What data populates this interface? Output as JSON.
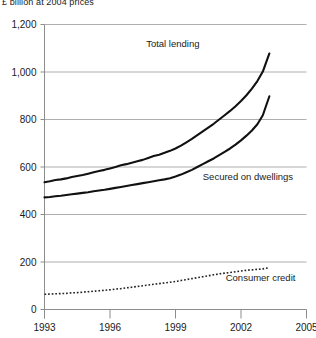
{
  "chart_data": {
    "type": "line",
    "title": "",
    "units_caption": "£ billion at 2004 prices",
    "xlabel": "",
    "ylabel": "",
    "xlim": [
      1993,
      2005
    ],
    "ylim": [
      0,
      1200
    ],
    "grid": true,
    "legend_position": "inline-annotations",
    "y_ticks": [
      "0",
      "200",
      "400",
      "600",
      "800",
      "1,000",
      "1,200"
    ],
    "y_tick_values": [
      0,
      200,
      400,
      600,
      800,
      1000,
      1200
    ],
    "x_ticks": [
      "1993",
      "1996",
      "1999",
      "2002",
      "2005"
    ],
    "x_tick_values": [
      1993,
      1996,
      1999,
      2002,
      2005
    ],
    "x": [
      1993.0,
      1993.25,
      1993.5,
      1993.75,
      1994.0,
      1994.25,
      1994.5,
      1994.75,
      1995.0,
      1995.25,
      1995.5,
      1995.75,
      1996.0,
      1996.25,
      1996.5,
      1996.75,
      1997.0,
      1997.25,
      1997.5,
      1997.75,
      1998.0,
      1998.25,
      1998.5,
      1998.75,
      1999.0,
      1999.25,
      1999.5,
      1999.75,
      2000.0,
      2000.25,
      2000.5,
      2000.75,
      2001.0,
      2001.25,
      2001.5,
      2001.75,
      2002.0,
      2002.25,
      2002.5,
      2002.75,
      2003.0,
      2003.3
    ],
    "series": [
      {
        "name": "Total lending",
        "style": "solid",
        "color": "#111111",
        "label_x": 2000.1,
        "label_y": 1105,
        "values": [
          536,
          540,
          545,
          548,
          552,
          558,
          562,
          566,
          572,
          578,
          583,
          588,
          594,
          600,
          607,
          612,
          618,
          624,
          630,
          638,
          646,
          652,
          660,
          668,
          678,
          690,
          704,
          718,
          734,
          750,
          766,
          782,
          800,
          818,
          836,
          856,
          878,
          902,
          930,
          962,
          1002,
          1078
        ]
      },
      {
        "name": "Secured on dwellings",
        "style": "solid",
        "color": "#111111",
        "label_x": 2000.25,
        "label_y": 545,
        "values": [
          472,
          474,
          477,
          479,
          482,
          485,
          488,
          491,
          494,
          498,
          501,
          504,
          508,
          512,
          516,
          520,
          524,
          528,
          532,
          536,
          540,
          544,
          548,
          553,
          560,
          568,
          578,
          588,
          600,
          612,
          624,
          636,
          650,
          664,
          678,
          694,
          712,
          732,
          754,
          780,
          818,
          898
        ]
      },
      {
        "name": "Consumer credit",
        "style": "dotted",
        "color": "#222222",
        "label_x": 2001.3,
        "label_y": 120,
        "values": [
          64,
          65,
          66,
          67,
          68,
          70,
          71,
          73,
          75,
          77,
          79,
          81,
          83,
          86,
          88,
          91,
          94,
          97,
          100,
          103,
          106,
          109,
          112,
          115,
          118,
          122,
          126,
          130,
          134,
          138,
          142,
          146,
          150,
          153,
          156,
          159,
          162,
          165,
          167,
          169,
          171,
          176
        ]
      }
    ]
  }
}
